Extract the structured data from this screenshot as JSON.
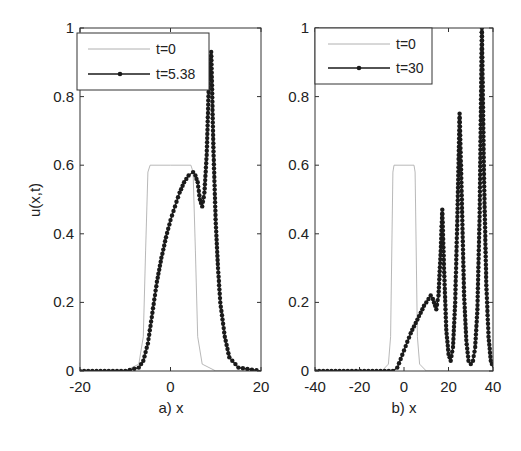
{
  "figure": {
    "ylabel": "u(x,t)",
    "panels": [
      {
        "id": "a",
        "xlabel": "a)  x",
        "legend": [
          "t=0",
          "t=5.38"
        ],
        "xticks": [
          "-20",
          "0",
          "20"
        ],
        "yticks": [
          "0",
          "0.2",
          "0.4",
          "0.6",
          "0.8",
          "1"
        ]
      },
      {
        "id": "b",
        "xlabel": "b)  x",
        "legend": [
          "t=0",
          "t=30"
        ],
        "xticks": [
          "-40",
          "-20",
          "0",
          "20",
          "40"
        ],
        "yticks": [
          "0",
          "0.2",
          "0.4",
          "0.6",
          "0.8",
          "1"
        ]
      }
    ]
  },
  "colors": {
    "initial": "#b0b0b0",
    "evolved": "#1a1a1a",
    "axes": "#333333"
  },
  "chart_data": [
    {
      "type": "line",
      "title": "",
      "panel_label": "a)",
      "xlabel": "x",
      "ylabel": "u(x,t)",
      "xlim": [
        -20,
        20
      ],
      "ylim": [
        0,
        1
      ],
      "grid": false,
      "legend_position": "upper left",
      "series": [
        {
          "name": "t=0",
          "style": "thin gray line",
          "x": [
            -20,
            -10,
            -7,
            -6,
            -5.5,
            -5,
            -4.5,
            0,
            4.5,
            5,
            5.5,
            6,
            7,
            10,
            20
          ],
          "y": [
            0,
            0,
            0.02,
            0.1,
            0.35,
            0.58,
            0.6,
            0.6,
            0.6,
            0.58,
            0.35,
            0.1,
            0.02,
            0,
            0
          ]
        },
        {
          "name": "t=5.38",
          "style": "black line with dot markers",
          "x": [
            -20,
            -10,
            -7,
            -6,
            -5,
            -4,
            -3,
            -2,
            -1,
            0,
            1,
            2,
            3,
            4,
            5,
            5.5,
            6,
            6.5,
            7,
            7.5,
            8,
            8.5,
            9,
            9.5,
            10,
            10.5,
            11,
            12,
            13,
            15,
            20
          ],
          "y": [
            0,
            0,
            0.01,
            0.03,
            0.08,
            0.17,
            0.26,
            0.33,
            0.39,
            0.44,
            0.48,
            0.52,
            0.55,
            0.57,
            0.58,
            0.57,
            0.55,
            0.5,
            0.48,
            0.52,
            0.63,
            0.85,
            0.93,
            0.64,
            0.43,
            0.3,
            0.2,
            0.1,
            0.04,
            0.01,
            0
          ]
        }
      ]
    },
    {
      "type": "line",
      "title": "",
      "panel_label": "b)",
      "xlabel": "x",
      "ylabel": "",
      "xlim": [
        -40,
        40
      ],
      "ylim": [
        0,
        1
      ],
      "grid": false,
      "legend_position": "upper left",
      "series": [
        {
          "name": "t=0",
          "style": "thin gray line",
          "x": [
            -40,
            -10,
            -7,
            -6,
            -5,
            -4.5,
            0,
            4.5,
            5,
            6,
            7,
            10,
            40
          ],
          "y": [
            0,
            0,
            0.02,
            0.1,
            0.58,
            0.6,
            0.6,
            0.6,
            0.58,
            0.1,
            0.02,
            0,
            0
          ]
        },
        {
          "name": "t=30",
          "style": "black line with dot markers",
          "x": [
            -40,
            -5,
            -3,
            0,
            3,
            6,
            9,
            12,
            13,
            14.5,
            15.5,
            16.5,
            17.2,
            18,
            19,
            20,
            21,
            22,
            23,
            24,
            25,
            26,
            27,
            28,
            29,
            30,
            31,
            32,
            33,
            34,
            35,
            36,
            37,
            38,
            39,
            40
          ],
          "y": [
            0,
            0,
            0.01,
            0.06,
            0.11,
            0.15,
            0.19,
            0.22,
            0.21,
            0.18,
            0.22,
            0.35,
            0.47,
            0.3,
            0.12,
            0.05,
            0.03,
            0.07,
            0.2,
            0.45,
            0.75,
            0.5,
            0.22,
            0.09,
            0.03,
            0.02,
            0.03,
            0.07,
            0.18,
            0.45,
            1.0,
            0.55,
            0.25,
            0.1,
            0.03,
            0.01
          ]
        }
      ]
    }
  ]
}
